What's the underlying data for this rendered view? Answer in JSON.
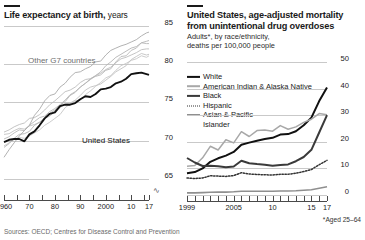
{
  "left": {
    "title_bold": "Life expectancy at birth,",
    "title_light": "years",
    "annotations": {
      "g7": "Other G7 countries",
      "us": "United States"
    },
    "axis_break_glyph": "∿",
    "chart_data": {
      "type": "line",
      "title": "Life expectancy at birth, years",
      "xlabel": "",
      "ylabel": "years",
      "ylim": [
        63,
        85
      ],
      "xlim": [
        1960,
        2017
      ],
      "grid": true,
      "legend": "inline-annotation",
      "yticks": [
        65,
        70,
        75,
        80,
        85
      ],
      "xticks": [
        1960,
        1965,
        1970,
        1975,
        1980,
        1985,
        1990,
        1995,
        2000,
        2005,
        2010,
        2015,
        2017
      ],
      "xticklabels": [
        "1960",
        "70",
        "80",
        "90",
        "2000",
        "10",
        "17"
      ],
      "xticklabel_values": [
        1960,
        1970,
        1980,
        1990,
        2000,
        2010,
        2017
      ],
      "x": [
        1960,
        1962,
        1964,
        1966,
        1968,
        1970,
        1972,
        1974,
        1976,
        1978,
        1980,
        1982,
        1984,
        1986,
        1988,
        1990,
        1992,
        1994,
        1996,
        1998,
        2000,
        2002,
        2004,
        2006,
        2008,
        2010,
        2012,
        2014,
        2016,
        2017
      ],
      "series": [
        {
          "name": "United States",
          "color": "#111111",
          "values": [
            69.8,
            70.1,
            70.2,
            70.2,
            69.9,
            70.8,
            71.2,
            72.0,
            72.9,
            73.5,
            73.7,
            74.5,
            74.7,
            74.7,
            74.9,
            75.4,
            75.8,
            75.7,
            76.1,
            76.7,
            76.8,
            77.0,
            77.5,
            77.7,
            78.1,
            78.7,
            78.8,
            78.9,
            78.7,
            78.6
          ]
        },
        {
          "name": "Japan",
          "color": "#a9a9a9",
          "values": [
            67.8,
            68.8,
            69.7,
            70.6,
            71.3,
            72.0,
            73.3,
            74.1,
            75.2,
            75.9,
            76.1,
            77.0,
            77.5,
            78.3,
            78.9,
            79.0,
            79.4,
            79.7,
            80.3,
            80.4,
            81.2,
            81.8,
            82.1,
            82.4,
            82.6,
            82.9,
            83.2,
            83.7,
            84.1,
            84.2
          ]
        },
        {
          "name": "Italy",
          "color": "#b4b4b4",
          "values": [
            69.1,
            69.6,
            70.3,
            70.8,
            70.9,
            71.2,
            72.0,
            72.4,
            73.0,
            73.6,
            74.0,
            74.6,
            75.1,
            75.9,
            76.3,
            77.0,
            77.5,
            78.0,
            78.5,
            79.0,
            79.8,
            80.3,
            80.9,
            81.3,
            81.7,
            82.1,
            82.3,
            82.8,
            83.0,
            83.1
          ]
        },
        {
          "name": "France",
          "color": "#b8b8b8",
          "values": [
            70.2,
            70.5,
            71.0,
            71.4,
            71.3,
            72.0,
            72.5,
            73.0,
            73.2,
            73.8,
            74.2,
            74.7,
            75.3,
            76.0,
            76.4,
            77.0,
            77.5,
            78.1,
            78.4,
            78.6,
            79.2,
            79.4,
            80.3,
            81.0,
            81.1,
            81.8,
            82.1,
            82.8,
            82.7,
            82.7
          ]
        },
        {
          "name": "Canada",
          "color": "#bdbdbd",
          "values": [
            71.1,
            71.4,
            71.8,
            72.1,
            72.3,
            72.9,
            73.0,
            73.4,
            74.0,
            74.7,
            75.2,
            75.8,
            76.4,
            76.6,
            77.0,
            77.6,
            78.0,
            78.1,
            78.5,
            78.8,
            79.3,
            79.6,
            80.2,
            80.7,
            80.9,
            81.2,
            81.5,
            81.9,
            82.0,
            82.0
          ]
        },
        {
          "name": "United Kingdom",
          "color": "#c2c2c2",
          "values": [
            70.8,
            70.9,
            71.3,
            71.6,
            71.5,
            71.9,
            72.1,
            72.4,
            72.9,
            73.2,
            73.8,
            74.3,
            74.8,
            74.9,
            75.3,
            75.9,
            76.6,
            77.0,
            77.2,
            77.4,
            77.9,
            78.4,
            79.0,
            79.4,
            79.8,
            80.6,
            81.0,
            81.4,
            81.2,
            81.3
          ]
        },
        {
          "name": "Germany",
          "color": "#c6c6c6",
          "values": [
            69.3,
            69.7,
            70.2,
            70.4,
            70.3,
            70.6,
            71.0,
            71.4,
            72.0,
            72.4,
            72.9,
            73.4,
            74.3,
            74.8,
            75.2,
            75.3,
            76.0,
            76.5,
            77.1,
            77.6,
            78.2,
            78.5,
            79.2,
            79.8,
            80.1,
            80.5,
            80.7,
            81.1,
            80.9,
            81.1
          ]
        }
      ]
    }
  },
  "right": {
    "title_line1": "United States, age-adjusted mortality",
    "title_line2": "from unintentional drug overdoses",
    "subtitle_line1": "Adults*, by race/ethnicity,",
    "subtitle_line2": "deaths per 100,000 people",
    "footnote": "*Aged 25–64",
    "legend": [
      {
        "label": "White",
        "marker": "solid-black"
      },
      {
        "label": "American Indian & Alaska Native",
        "marker": "solid-light-gray"
      },
      {
        "label": "Black",
        "marker": "solid-dark-gray"
      },
      {
        "label": "Hispanic",
        "marker": "dotted"
      },
      {
        "label": "Asian & Pacific",
        "label2": "Islander",
        "marker": "solid-gray"
      }
    ],
    "chart_data": {
      "type": "line",
      "title": "United States, age-adjusted mortality from unintentional drug overdoses",
      "subtitle": "Adults*, by race/ethnicity, deaths per 100,000 people",
      "xlabel": "",
      "ylabel": "deaths per 100,000 people",
      "ylim": [
        0,
        50
      ],
      "xlim": [
        1999,
        2017
      ],
      "grid": true,
      "legend_position": "top-left",
      "yticks": [
        0,
        10,
        20,
        30,
        40,
        50
      ],
      "xticks": [
        1999,
        2000,
        2001,
        2002,
        2003,
        2004,
        2005,
        2006,
        2007,
        2008,
        2009,
        2010,
        2011,
        2012,
        2013,
        2014,
        2015,
        2016,
        2017
      ],
      "xticklabels": [
        "1999",
        "2005",
        "10",
        "15",
        "17"
      ],
      "xticklabel_values": [
        1999,
        2005,
        2010,
        2015,
        2017
      ],
      "x": [
        1999,
        2000,
        2001,
        2002,
        2003,
        2004,
        2005,
        2006,
        2007,
        2008,
        2009,
        2010,
        2011,
        2012,
        2013,
        2014,
        2015,
        2016,
        2017
      ],
      "series": [
        {
          "name": "White",
          "color": "#111111",
          "values": [
            8.2,
            8.6,
            10.0,
            12.5,
            13.8,
            14.8,
            16.2,
            18.9,
            19.7,
            20.4,
            21.0,
            21.5,
            22.7,
            22.9,
            24.0,
            26.2,
            29.1,
            35.3,
            40.4
          ]
        },
        {
          "name": "American Indian & Alaska Native",
          "color": "#a8a8a8",
          "values": [
            10.8,
            11.1,
            14.0,
            18.3,
            16.9,
            20.8,
            19.6,
            23.8,
            22.0,
            24.2,
            24.4,
            24.0,
            26.1,
            24.7,
            25.6,
            27.3,
            28.5,
            30.6,
            30.2
          ]
        },
        {
          "name": "Black",
          "color": "#3a3a3a",
          "values": [
            13.9,
            12.2,
            10.9,
            11.0,
            10.8,
            10.4,
            10.7,
            12.9,
            11.9,
            11.6,
            11.4,
            11.0,
            11.3,
            11.5,
            12.7,
            14.3,
            17.0,
            23.5,
            30.0
          ]
        },
        {
          "name": "Hispanic",
          "color": "#333333",
          "values": [
            6.4,
            6.2,
            6.4,
            7.2,
            7.1,
            7.0,
            7.3,
            8.4,
            7.9,
            7.7,
            7.6,
            7.5,
            7.8,
            7.8,
            8.2,
            8.8,
            9.6,
            11.4,
            13.0
          ]
        },
        {
          "name": "Asian & Pacific Islander",
          "color": "#8f8f8f",
          "values": [
            0.8,
            0.8,
            0.9,
            1.0,
            1.1,
            1.1,
            1.2,
            1.4,
            1.4,
            1.4,
            1.4,
            1.4,
            1.5,
            1.5,
            1.6,
            1.8,
            2.0,
            2.5,
            3.1
          ]
        }
      ]
    }
  },
  "sources": "Sources: OECD; Centres for Disease Control and Prevention"
}
